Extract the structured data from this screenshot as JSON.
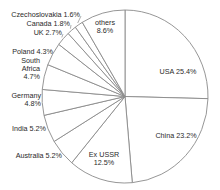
{
  "chart_data": {
    "type": "pie",
    "title": "",
    "start": "12 o'clock",
    "direction": "clockwise",
    "slices": [
      {
        "name": "USA",
        "value": 25.4,
        "label": [
          "USA 25.4%"
        ]
      },
      {
        "name": "China",
        "value": 23.2,
        "label": [
          "China 23.2%"
        ]
      },
      {
        "name": "Ex USSR",
        "value": 12.5,
        "label": [
          "Ex USSR",
          "12.5%"
        ]
      },
      {
        "name": "Australia",
        "value": 5.2,
        "label": [
          "Australia 5.2%"
        ]
      },
      {
        "name": "India",
        "value": 5.2,
        "label": [
          "India 5.2%"
        ]
      },
      {
        "name": "Germany",
        "value": 4.8,
        "label": [
          "Germany",
          "4.8%"
        ]
      },
      {
        "name": "South Africa",
        "value": 4.7,
        "label": [
          "South",
          "Africa",
          "4.7%"
        ]
      },
      {
        "name": "Poland",
        "value": 4.3,
        "label": [
          "Poland 4.3%"
        ]
      },
      {
        "name": "UK",
        "value": 2.7,
        "label": [
          "UK 2.7%"
        ]
      },
      {
        "name": "Canada",
        "value": 1.8,
        "label": [
          "Canada 1.8%"
        ]
      },
      {
        "name": "Czechoslovakia",
        "value": 1.6,
        "label": [
          "Czechoslovakia 1.6%"
        ]
      },
      {
        "name": "others",
        "value": 8.6,
        "label": [
          "others",
          "8.6%"
        ]
      }
    ],
    "colors": {
      "fill": "#ffffff",
      "stroke": "#8a8a8a",
      "text": "#2a2a2a"
    }
  }
}
